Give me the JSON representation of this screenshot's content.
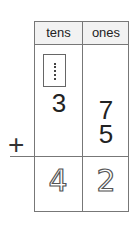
{
  "worksheet": {
    "headers": {
      "tens": "tens",
      "ones": "ones"
    },
    "carry": {
      "tens": "1"
    },
    "addend1": {
      "tens": "3",
      "ones": "7"
    },
    "addend2": {
      "ones": "5"
    },
    "operator": "+",
    "sum": {
      "tens": "4",
      "ones": "2"
    }
  }
}
